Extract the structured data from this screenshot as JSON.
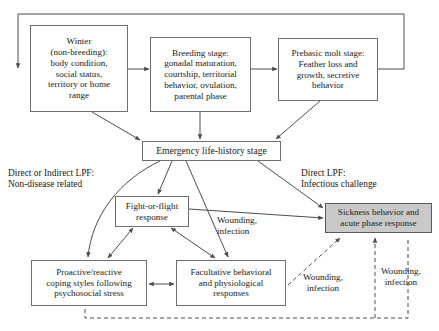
{
  "figure": {
    "kind": "flow-diagram",
    "background_color": "#ffffff",
    "line_color": "#4d4d4d",
    "shaded_node_fill": "#c9c9c9",
    "text_color": "#1a1a1a"
  },
  "nodes": {
    "winter": {
      "label": "Winter\n(non-breeding):\nbody condition,\nsocial status,\nterritory or home\nrange"
    },
    "breeding": {
      "label": "Breeding stage:\ngonadal maturation,\ncourtship, territorial\nbehavior, ovulation,\nparental phase"
    },
    "molt": {
      "label": "Prebasic molt stage:\nFeather loss and\ngrowth, secretive\nbehavior"
    },
    "emergency": {
      "label": "Emergency life-history stage"
    },
    "fight_or_flight": {
      "label": "Fight-or-flight\nresponse"
    },
    "sickness": {
      "label": "Sickness behavior and\nacute phase response"
    },
    "coping": {
      "label": "Proactive/reactive\ncoping styles following\npsychosocial stress"
    },
    "facultative": {
      "label": "Facultative behavioral\nand physiological\nresponses"
    }
  },
  "annotations": {
    "left_pathway": "Direct or Indirect LPF:\nNon-disease related",
    "right_pathway": "Direct LPF:\nInfectious challenge"
  },
  "edge_labels": {
    "wounding_center": "Wounding,\ninfection",
    "wounding_lower": "Wounding,\ninfection",
    "wounding_right": "Wounding,\ninfection"
  }
}
